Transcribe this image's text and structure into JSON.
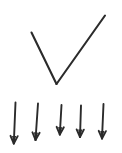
{
  "canvas": {
    "width": 122,
    "height": 153,
    "background_color": "#ffffff",
    "ink_color": "#2b2b2b",
    "description": "hand-drawn checkmark above a row of five downward arrows"
  },
  "figure": {
    "title": "",
    "checkmark": {
      "name": "checkmark",
      "stroke_color": "#2b2b2b",
      "stroke_width": 2.1,
      "left_arm": {
        "x1": 31.5,
        "y1": 32.5,
        "x2": 56.5,
        "y2": 84.0
      },
      "right_arm": {
        "x1": 56.5,
        "y1": 84.0,
        "x2": 105.0,
        "y2": 15.5
      }
    },
    "arrows": {
      "name": "downward-arrow-row",
      "count": 5,
      "direction": "down",
      "stroke_color": "#2b2b2b",
      "stroke_width": 1.9,
      "head_length": 7.5,
      "head_half_width": 3.6,
      "items": [
        {
          "label": "arrow-1",
          "x1": 15.5,
          "y1": 102.5,
          "x2": 13.8,
          "y2": 143.5
        },
        {
          "label": "arrow-2",
          "x1": 38.0,
          "y1": 103.5,
          "x2": 35.5,
          "y2": 140.0
        },
        {
          "label": "arrow-3",
          "x1": 61.5,
          "y1": 105.0,
          "x2": 59.8,
          "y2": 134.5
        },
        {
          "label": "arrow-4",
          "x1": 81.0,
          "y1": 105.5,
          "x2": 80.0,
          "y2": 137.0
        },
        {
          "label": "arrow-5",
          "x1": 103.5,
          "y1": 104.0,
          "x2": 102.0,
          "y2": 138.5
        }
      ]
    }
  }
}
